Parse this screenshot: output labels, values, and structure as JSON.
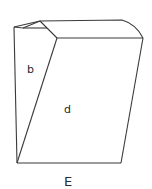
{
  "diagram": {
    "type": "crystal-drawing",
    "face_labels": {
      "left_face": "b",
      "front_face": "d",
      "bottom_caption": "E"
    },
    "stroke_color": "#3a3a3a",
    "background": "#ffffff"
  }
}
